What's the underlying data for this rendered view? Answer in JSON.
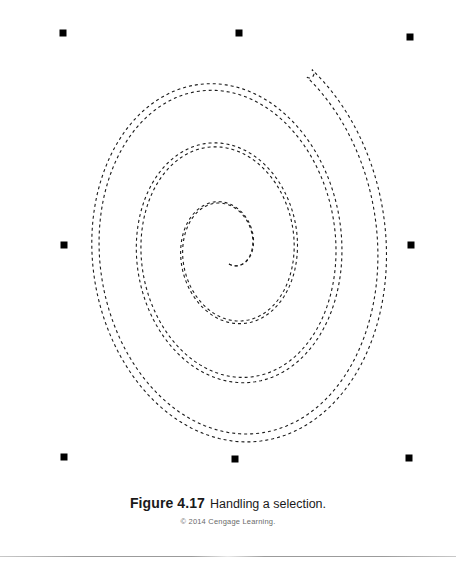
{
  "page": {
    "background_color": "#ffffff",
    "width": 456,
    "height": 580
  },
  "figure": {
    "canvas": {
      "x": 0,
      "y": 0,
      "width": 456,
      "height": 480
    },
    "stroke_color": "#1b1b1b",
    "stroke_width": 1.1,
    "dash_pattern": "3 3",
    "spiral": {
      "center_x": 228,
      "center_y": 248,
      "turns": 3.4,
      "start_radius_x": 14,
      "start_radius_y": 16,
      "end_radius_x": 160,
      "end_radius_y": 214,
      "outline_offset": 9,
      "direction": "counterclockwise",
      "start_angle_deg": 95,
      "tilt_deg": -8,
      "end_cap": "round"
    },
    "selection": {
      "handle_color": "#000000",
      "handle_size": 7,
      "handle_count": 8,
      "bounds": {
        "left": 63,
        "top": 33,
        "right": 411,
        "bottom": 459
      },
      "handles": [
        {
          "name": "handle-top-left",
          "x": 63,
          "y": 33
        },
        {
          "name": "handle-top-center",
          "x": 239,
          "y": 33
        },
        {
          "name": "handle-top-right",
          "x": 410,
          "y": 37
        },
        {
          "name": "handle-middle-left",
          "x": 64,
          "y": 245
        },
        {
          "name": "handle-middle-right",
          "x": 411,
          "y": 245
        },
        {
          "name": "handle-bottom-left",
          "x": 64,
          "y": 457
        },
        {
          "name": "handle-bottom-center",
          "x": 235,
          "y": 459
        },
        {
          "name": "handle-bottom-right",
          "x": 409,
          "y": 458
        }
      ]
    }
  },
  "caption": {
    "label": "Figure 4.17",
    "title": "Handling a selection.",
    "copyright": "© 2014 Cengage Learning."
  },
  "footer": {
    "rule_color": "#9b9b9b"
  }
}
